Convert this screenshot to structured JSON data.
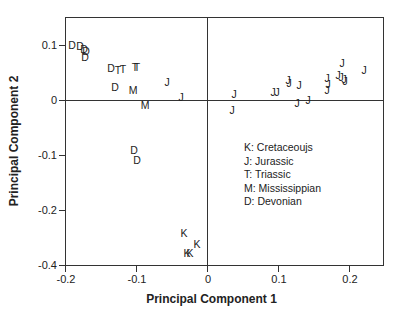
{
  "chart_data": {
    "type": "scatter",
    "title": "",
    "xlabel": "Principal Component 1",
    "ylabel": "Principal Component 2",
    "xlim": [
      -0.2,
      0.25
    ],
    "ylim": [
      -0.4,
      0.15
    ],
    "x_ticks": [
      "-0.2",
      "-0.1",
      "0",
      "0.1",
      "0.2"
    ],
    "y_ticks": [
      "0.1",
      "0",
      "-0.1",
      "-0.2",
      "-0.4"
    ],
    "grid": false,
    "reference_lines": [
      "x=0",
      "y=0"
    ],
    "legend": [
      {
        "symbol": "K",
        "label": "K: Cretaceoujs"
      },
      {
        "symbol": "J",
        "label": "J: Jurassic"
      },
      {
        "symbol": "T",
        "label": "T: Triassic"
      },
      {
        "symbol": "M",
        "label": "M: Mississippian"
      },
      {
        "symbol": "D",
        "label": "D: Devonian"
      }
    ],
    "legend_position": "inside lower right",
    "series": [
      {
        "name": "Devonian",
        "symbol": "D",
        "points": [
          {
            "x": -0.19,
            "y": 0.1,
            "px": 72,
            "py": 45
          },
          {
            "x": -0.18,
            "y": 0.1,
            "px": 80,
            "py": 46
          },
          {
            "x": -0.175,
            "y": 0.095,
            "px": 84,
            "py": 49
          },
          {
            "x": -0.172,
            "y": 0.093,
            "px": 86,
            "py": 51
          },
          {
            "x": -0.175,
            "y": 0.08,
            "px": 85,
            "py": 57
          },
          {
            "x": -0.135,
            "y": 0.06,
            "px": 111,
            "py": 68
          },
          {
            "x": -0.13,
            "y": 0.02,
            "px": 115,
            "py": 87
          },
          {
            "x": -0.1,
            "y": -0.1,
            "px": 134,
            "py": 150
          },
          {
            "x": -0.097,
            "y": -0.11,
            "px": 137,
            "py": 160
          }
        ]
      },
      {
        "name": "Triassic",
        "symbol": "T",
        "points": [
          {
            "x": -0.125,
            "y": 0.055,
            "px": 118,
            "py": 70
          },
          {
            "x": -0.118,
            "y": 0.058,
            "px": 123,
            "py": 69
          },
          {
            "x": -0.1,
            "y": 0.06,
            "px": 135,
            "py": 67
          },
          {
            "x": -0.097,
            "y": 0.06,
            "px": 137,
            "py": 67
          }
        ]
      },
      {
        "name": "Mississippian",
        "symbol": "M",
        "points": [
          {
            "x": -0.1,
            "y": 0.02,
            "px": 133,
            "py": 90
          },
          {
            "x": -0.085,
            "y": -0.01,
            "px": 145,
            "py": 105
          }
        ]
      },
      {
        "name": "Jurassic",
        "symbol": "J",
        "points": [
          {
            "x": -0.05,
            "y": 0.035,
            "px": 167,
            "py": 82
          },
          {
            "x": -0.04,
            "y": 0.005,
            "px": 181,
            "py": 97
          },
          {
            "x": 0.04,
            "y": 0.01,
            "px": 234,
            "py": 94
          },
          {
            "x": 0.035,
            "y": -0.02,
            "px": 232,
            "py": 110
          },
          {
            "x": 0.08,
            "y": 0.015,
            "px": 273,
            "py": 92
          },
          {
            "x": 0.085,
            "y": 0.015,
            "px": 277,
            "py": 92
          },
          {
            "x": 0.11,
            "y": 0.035,
            "px": 288,
            "py": 80
          },
          {
            "x": 0.112,
            "y": 0.03,
            "px": 289,
            "py": 83
          },
          {
            "x": 0.128,
            "y": 0.025,
            "px": 299,
            "py": 85
          },
          {
            "x": 0.125,
            "y": -0.002,
            "px": 297,
            "py": 103
          },
          {
            "x": 0.14,
            "y": 0.0,
            "px": 308,
            "py": 100
          },
          {
            "x": 0.17,
            "y": 0.035,
            "px": 327,
            "py": 78
          },
          {
            "x": 0.172,
            "y": 0.025,
            "px": 328,
            "py": 84
          },
          {
            "x": 0.17,
            "y": 0.015,
            "px": 327,
            "py": 90
          },
          {
            "x": 0.18,
            "y": 0.06,
            "px": 342,
            "py": 63
          },
          {
            "x": 0.178,
            "y": 0.04,
            "px": 338,
            "py": 75
          },
          {
            "x": 0.185,
            "y": 0.04,
            "px": 341,
            "py": 77
          },
          {
            "x": 0.19,
            "y": 0.035,
            "px": 344,
            "py": 79
          },
          {
            "x": 0.2,
            "y": 0.03,
            "px": 345,
            "py": 81
          },
          {
            "x": 0.22,
            "y": 0.05,
            "px": 364,
            "py": 70
          }
        ]
      },
      {
        "name": "Cretaceous",
        "symbol": "K",
        "points": [
          {
            "x": -0.035,
            "y": -0.25,
            "px": 184,
            "py": 233
          },
          {
            "x": -0.03,
            "y": -0.38,
            "px": 187,
            "py": 253
          },
          {
            "x": -0.025,
            "y": -0.38,
            "px": 190,
            "py": 253
          },
          {
            "x": -0.015,
            "y": -0.36,
            "px": 197,
            "py": 244
          }
        ]
      }
    ]
  }
}
